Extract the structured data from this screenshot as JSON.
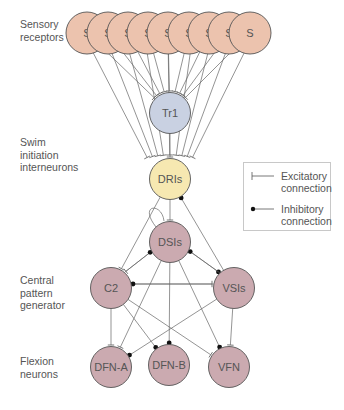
{
  "labels": {
    "sensory": [
      "Sensory",
      "receptors"
    ],
    "swim": [
      "Swim",
      "initiation",
      "interneurons"
    ],
    "cpg": [
      "Central",
      "pattern",
      "generator"
    ],
    "flexion": [
      "Flexion",
      "neurons"
    ]
  },
  "legend": {
    "excitatory": [
      "Excitatory",
      "connection"
    ],
    "inhibitory": [
      "Inhibitory",
      "connection"
    ]
  },
  "colors": {
    "sensory_fill": "#ecc3ae",
    "tr1_fill": "#c9d1e2",
    "dri_fill": "#f6e8b1",
    "cpg_fill": "#cbaab0",
    "stroke": "#555555",
    "line": "#666666"
  },
  "nodes": {
    "sensory": [
      {
        "id": "S1",
        "label": "S",
        "x": 87,
        "y": 33
      },
      {
        "id": "S2",
        "label": "S",
        "x": 108,
        "y": 33
      },
      {
        "id": "S3",
        "label": "S",
        "x": 128,
        "y": 33
      },
      {
        "id": "S4",
        "label": "S",
        "x": 148,
        "y": 33
      },
      {
        "id": "S5",
        "label": "S",
        "x": 168,
        "y": 33
      },
      {
        "id": "S6",
        "label": "S",
        "x": 189,
        "y": 33
      },
      {
        "id": "S7",
        "label": "S",
        "x": 209,
        "y": 33
      },
      {
        "id": "S8",
        "label": "S",
        "x": 229,
        "y": 33
      },
      {
        "id": "S9",
        "label": "S",
        "x": 250,
        "y": 33
      }
    ],
    "tr1": {
      "id": "Tr1",
      "label": "Tr1",
      "x": 170,
      "y": 113
    },
    "dri": {
      "id": "DRIs",
      "label": "DRIs",
      "x": 170,
      "y": 179
    },
    "dsi": {
      "id": "DSIs",
      "label": "DSIs",
      "x": 170,
      "y": 242
    },
    "c2": {
      "id": "C2",
      "label": "C2",
      "x": 111,
      "y": 288
    },
    "vsi": {
      "id": "VSIs",
      "label": "VSIs",
      "x": 234,
      "y": 288
    },
    "dfna": {
      "id": "DFN-A",
      "label": "DFN-A",
      "x": 111,
      "y": 367
    },
    "dfnb": {
      "id": "DFN-B",
      "label": "DFN-B",
      "x": 169,
      "y": 365
    },
    "vfn": {
      "id": "VFN",
      "label": "VFN",
      "x": 229,
      "y": 367
    }
  },
  "edges": [
    {
      "from": "Tr1",
      "to": "DRIs",
      "type": "excitatory"
    },
    {
      "from": "DRIs",
      "to": "DSIs",
      "type": "excitatory"
    },
    {
      "from": "DRIs",
      "to": "C2",
      "type": "excitatory"
    },
    {
      "from": "VSIs",
      "to": "DRIs",
      "type": "inhibitory"
    },
    {
      "from": "DSIs",
      "to": "DSIs",
      "type": "excitatory"
    },
    {
      "from": "DSIs",
      "to": "C2",
      "type": "excitatory"
    },
    {
      "from": "C2",
      "to": "DSIs",
      "type": "inhibitory"
    },
    {
      "from": "DSIs",
      "to": "VSIs",
      "type": "inhibitory"
    },
    {
      "from": "VSIs",
      "to": "DSIs",
      "type": "inhibitory"
    },
    {
      "from": "C2",
      "to": "VSIs",
      "type": "excitatory"
    },
    {
      "from": "VSIs",
      "to": "C2",
      "type": "inhibitory"
    },
    {
      "from": "C2",
      "to": "DFN-A",
      "type": "excitatory"
    },
    {
      "from": "C2",
      "to": "DFN-B",
      "type": "inhibitory"
    },
    {
      "from": "C2",
      "to": "VFN",
      "type": "excitatory"
    },
    {
      "from": "DSIs",
      "to": "DFN-A",
      "type": "excitatory"
    },
    {
      "from": "DSIs",
      "to": "DFN-B",
      "type": "inhibitory"
    },
    {
      "from": "DSIs",
      "to": "VFN",
      "type": "inhibitory"
    },
    {
      "from": "VSIs",
      "to": "DFN-A",
      "type": "inhibitory"
    },
    {
      "from": "VSIs",
      "to": "VFN",
      "type": "excitatory"
    }
  ]
}
